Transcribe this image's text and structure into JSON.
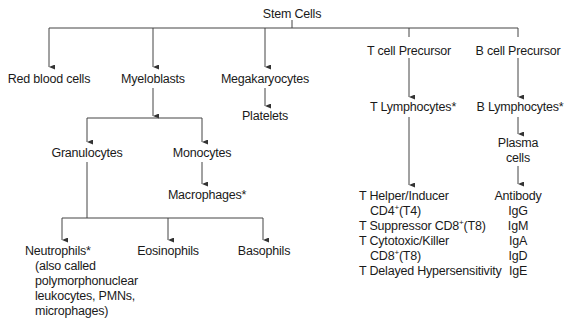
{
  "diagram": {
    "type": "tree",
    "root": "Stem Cells",
    "nodes": {
      "stem_cells": "Stem Cells",
      "red_blood_cells": "Red blood cells",
      "myeloblasts": "Myeloblasts",
      "megakaryocytes": "Megakaryocytes",
      "platelets": "Platelets",
      "t_cell_precursor": "T cell Precursor",
      "b_cell_precursor": "B cell Precursor",
      "t_lymphocytes": "T Lymphocytes*",
      "b_lymphocytes": "B Lymphocytes*",
      "plasma_line1": "Plasma",
      "plasma_line2": "cells",
      "granulocytes": "Granulocytes",
      "monocytes": "Monocytes",
      "macrophages": "Macrophages*",
      "neutrophils": "Neutrophils*",
      "neutrophils_note": [
        "(also called",
        "polymorphonuclear",
        "leukocytes, PMNs,",
        "microphages)"
      ],
      "eosinophils": "Eosinophils",
      "basophils": "Basophils"
    },
    "t_subtypes": {
      "helper_l1": "T Helper/Inducer",
      "helper_cd": "CD4",
      "helper_sup": "+",
      "helper_t": "(T4)",
      "suppressor_pre": "T Suppressor CD8",
      "suppressor_sup": "+",
      "suppressor_t": "(T8)",
      "cytotoxic_l1": "T Cytotoxic/Killer",
      "cytotoxic_cd": "CD8",
      "cytotoxic_sup": "+",
      "cytotoxic_t": "(T8)",
      "delayed": "T Delayed Hypersensitivity"
    },
    "antibodies": [
      "Antibody",
      "IgG",
      "IgM",
      "IgA",
      "IgD",
      "IgE"
    ]
  }
}
